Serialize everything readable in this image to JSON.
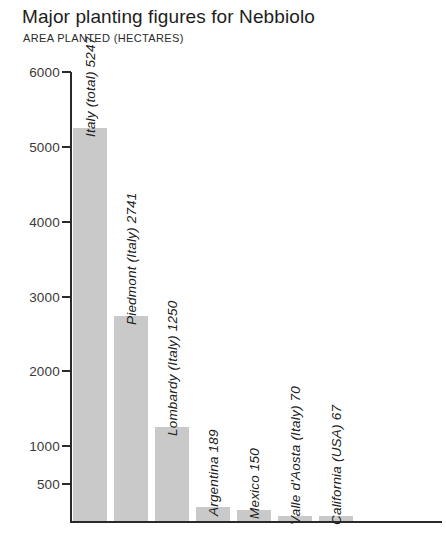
{
  "header": {
    "title": "Major planting figures for Nebbiolo",
    "subtitle": "AREA PLANTED (HECTARES)"
  },
  "colors": {
    "bar_fill": "#c9c9c9",
    "axis": "#2a2a2a",
    "text": "#1d1d1d",
    "background": "#ffffff"
  },
  "chart_data": {
    "type": "bar",
    "title": "Major planting figures for Nebbiolo",
    "subtitle": "AREA PLANTED (HECTARES)",
    "xlabel": "",
    "ylabel": "AREA PLANTED (HECTARES)",
    "ylim": [
      0,
      6000
    ],
    "grid": false,
    "legend": "none",
    "orientation": "vertical",
    "yticks": [
      500,
      1000,
      2000,
      3000,
      4000,
      5000,
      6000
    ],
    "ytick_labels": [
      "500",
      "1000",
      "2000",
      "3000",
      "4000",
      "5000",
      "6000"
    ],
    "categories": [
      "Italy (total)",
      "Piedmont (Italy)",
      "Lombardy (Italy)",
      "Argentina",
      "Mexico",
      "Valle d'Aosta (Italy)",
      "California (USA)"
    ],
    "values": [
      5247,
      2741,
      1250,
      189,
      150,
      70,
      67
    ],
    "bar_labels": [
      "Italy (total) 5247",
      "Piedmont (Italy) 2741",
      "Lombardy (Italy) 1250",
      "Argentina 189",
      "Mexico 150",
      "Valle d'Aosta (Italy) 70",
      "California (USA) 67"
    ]
  }
}
